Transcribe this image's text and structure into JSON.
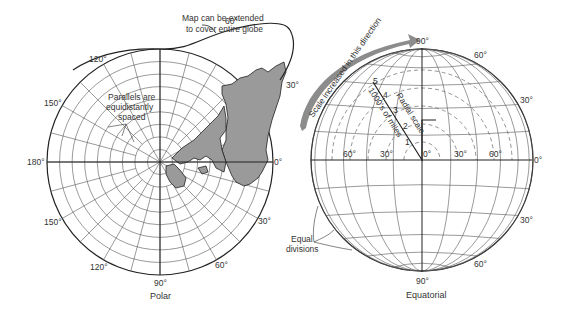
{
  "polar": {
    "caption": "Polar",
    "labels": {
      "deg_60_top": "60°",
      "deg_120_top": "120°",
      "deg_150_top": "150°",
      "deg_180": "180°",
      "deg_0": "0°",
      "deg_30_top": "30°",
      "deg_150_bottom": "150°",
      "deg_120_bottom": "120°",
      "deg_90_bottom": "90°",
      "deg_60_bottom": "60°",
      "deg_30_bottom": "30°"
    },
    "annotations": {
      "extend_line1": "Map can be extended",
      "extend_line2": "to cover entire globe",
      "parallels_line1": "Parallels are",
      "parallels_line2": "equidistantly",
      "parallels_line3": "spaced"
    }
  },
  "equatorial": {
    "caption": "Equatorial",
    "labels": {
      "deg_90_top": "90°",
      "deg_60_top": "60°",
      "deg_30_top": "30°",
      "deg_0_right": "0°",
      "deg_60_left": "60°",
      "deg_30_left": "30°",
      "deg_0_center": "0°",
      "deg_30_right": "30°",
      "deg_60_right": "60°",
      "deg_30_bottom": "30°",
      "deg_60_bottom": "60°",
      "deg_90_bottom": "90°"
    },
    "annotations": {
      "scale_arrow": "Scale increased in this direction",
      "radial_scale": "Radial scale",
      "miles": "1000's of miles",
      "equal_line1": "Equal",
      "equal_line2": "divisions"
    },
    "radial_ticks": [
      "1",
      "2",
      "3",
      "4",
      "5"
    ]
  }
}
